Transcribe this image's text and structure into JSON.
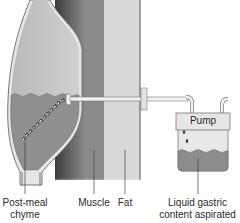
{
  "diagram": {
    "type": "medical-illustration",
    "labels": {
      "chyme": "Post-meal\nchyme",
      "chyme_line1": "Post-meal",
      "chyme_line2": "chyme",
      "muscle": "Muscle",
      "fat": "Fat",
      "liquid_line1": "Liquid gastric",
      "liquid_line2": "content aspirated",
      "pump": "Pump"
    },
    "colors": {
      "stomach_fill": "#c9c9c9",
      "stomach_wall": "#e8e8e8",
      "chyme_fill": "#8f8f8f",
      "muscle_dark": "#5a5a5a",
      "muscle": "#8a8a8a",
      "fat": "#d6d6d6",
      "jar_liquid": "#8c8c8c",
      "pump_box": "#e6e6e6"
    }
  }
}
